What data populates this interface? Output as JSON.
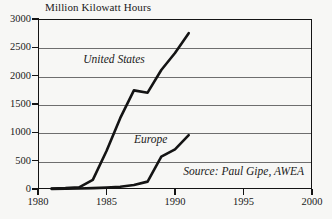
{
  "chart_data": {
    "type": "line",
    "title": "Million Kilowatt Hours",
    "xlabel": "",
    "ylabel": "",
    "xlim": [
      1980,
      2000
    ],
    "ylim": [
      0,
      3000
    ],
    "grid": true,
    "legend_position": "inline-annotations",
    "xticks": [
      "1980",
      "1985",
      "1990",
      "1995",
      "2000"
    ],
    "xtick_values": [
      1980,
      1985,
      1990,
      1995,
      2000
    ],
    "yticks": [
      "0",
      "500",
      "1000",
      "1500",
      "2000",
      "2500",
      "3000"
    ],
    "ytick_values": [
      0,
      500,
      1000,
      1500,
      2000,
      2500,
      3000
    ],
    "series": [
      {
        "name": "United States",
        "x": [
          1981,
          1982,
          1983,
          1984,
          1985,
          1986,
          1987,
          1988,
          1989,
          1990,
          1991
        ],
        "values": [
          10,
          15,
          30,
          160,
          670,
          1250,
          1740,
          1700,
          2100,
          2400,
          2750
        ]
      },
      {
        "name": "Europe",
        "x": [
          1981,
          1982,
          1983,
          1984,
          1985,
          1986,
          1987,
          1988,
          1989,
          1990,
          1991
        ],
        "values": [
          2,
          4,
          8,
          15,
          25,
          40,
          70,
          130,
          570,
          700,
          950
        ]
      }
    ],
    "annotations": [
      {
        "text": "United States",
        "x": 1983.3,
        "y": 2280
      },
      {
        "text": "Europe",
        "x": 1987.0,
        "y": 870
      },
      {
        "text": "Source: Paul Gipe, AWEA",
        "x": 1990.6,
        "y": 300
      }
    ],
    "colors": {
      "line": "#141414",
      "grid": "#6e6e6e",
      "axis": "#141414",
      "text": "#1a1a1a",
      "background": "#f7f7f5"
    }
  },
  "axes": {
    "y_labels": [
      "3000",
      "2500",
      "2000",
      "1500",
      "1000",
      "500",
      "0"
    ],
    "x_labels": [
      "1980",
      "1985",
      "1990",
      "1995",
      "2000"
    ]
  },
  "annotations": {
    "united_states": "United States",
    "europe": "Europe",
    "source": "Source: Paul Gipe, AWEA"
  }
}
